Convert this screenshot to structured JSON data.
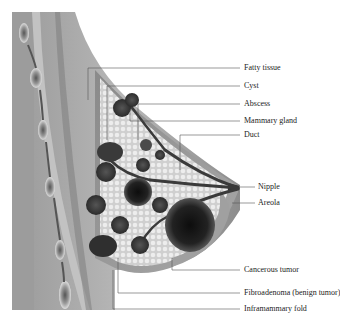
{
  "diagram": {
    "labels": [
      {
        "id": "fatty-tissue",
        "text": "Fatty tissue",
        "y": 68
      },
      {
        "id": "cyst",
        "text": "Cyst",
        "y": 86
      },
      {
        "id": "abscess",
        "text": "Abscess",
        "y": 104
      },
      {
        "id": "mammary-gland",
        "text": "Mammary gland",
        "y": 121
      },
      {
        "id": "duct",
        "text": "Duct",
        "y": 135
      },
      {
        "id": "nipple",
        "text": "Nipple",
        "y": 187
      },
      {
        "id": "areola",
        "text": "Areola",
        "y": 203
      },
      {
        "id": "cancerous-tumor",
        "text": "Cancerous tumor",
        "y": 270
      },
      {
        "id": "fibroadenoma",
        "text": "Fibroadenoma (benign tumor)",
        "y": 293
      },
      {
        "id": "inframammary-fold",
        "text": "Inframammary fold",
        "y": 309
      }
    ]
  }
}
